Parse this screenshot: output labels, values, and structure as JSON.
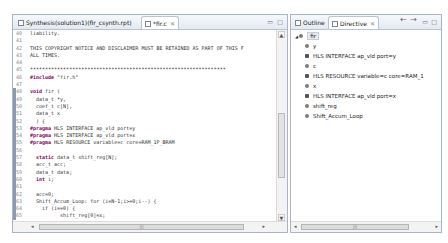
{
  "editor": {
    "tabs": [
      {
        "label": "Synthesis(solution1)(fir_csynth.rpt)",
        "active": false
      },
      {
        "label": "*fir.c",
        "active": true
      }
    ],
    "lines": [
      {
        "n": "40",
        "text": "liability."
      },
      {
        "n": "41",
        "text": ""
      },
      {
        "n": "42",
        "text": "THIS COPYRIGHT NOTICE AND DISCLAIMER MUST BE RETAINED AS PART OF THIS F"
      },
      {
        "n": "43",
        "text": "ALL TIMES."
      },
      {
        "n": "44",
        "text": ""
      },
      {
        "n": "45",
        "text": "*****************************************************************"
      },
      {
        "n": "46",
        "text": "#include \"fir.h\""
      },
      {
        "n": "47",
        "text": ""
      },
      {
        "n": "48",
        "text": "void fir ("
      },
      {
        "n": "49",
        "text": "  data_t *y,"
      },
      {
        "n": "50",
        "text": "  coef_t c[N],"
      },
      {
        "n": "51",
        "text": "  data_t x"
      },
      {
        "n": "52",
        "text": "  ) {"
      },
      {
        "n": "53",
        "text": "#pragma HLS INTERFACE ap_vld port=y"
      },
      {
        "n": "54",
        "text": "#pragma HLS INTERFACE ap_vld port=x"
      },
      {
        "n": "55",
        "text": "#pragma HLS RESOURCE variable=c core=RAM_1P_BRAM"
      },
      {
        "n": "56",
        "text": ""
      },
      {
        "n": "57",
        "text": "  static data_t shift_reg[N];"
      },
      {
        "n": "58",
        "text": "  acc_t acc;"
      },
      {
        "n": "59",
        "text": "  data_t data;"
      },
      {
        "n": "60",
        "text": "  int i;"
      },
      {
        "n": "61",
        "text": ""
      },
      {
        "n": "62",
        "text": "  acc=0;"
      },
      {
        "n": "63",
        "text": "  Shift_Accum_Loop: for (i=N-1;i>=0;i--) {"
      },
      {
        "n": "64",
        "text": "    if (i==0) {"
      },
      {
        "n": "65",
        "text": "          shift_reg[0]=x;"
      }
    ]
  },
  "side": {
    "tabs": [
      {
        "label": "Outline",
        "active": false
      },
      {
        "label": "Directive",
        "active": true
      }
    ],
    "tree": [
      {
        "label": "fir",
        "level": 0,
        "icon": "function-icon"
      },
      {
        "label": "y",
        "level": 1,
        "icon": "port-icon"
      },
      {
        "label": "HLS INTERFACE ap_vld port=y",
        "level": 1,
        "icon": "directive-icon"
      },
      {
        "label": "c",
        "level": 1,
        "icon": "port-icon"
      },
      {
        "label": "HLS RESOURCE variable=c core=RAM_1",
        "level": 1,
        "icon": "directive-icon"
      },
      {
        "label": "x",
        "level": 1,
        "icon": "port-icon"
      },
      {
        "label": "HLS INTERFACE ap_vld port=x",
        "level": 1,
        "icon": "directive-icon"
      },
      {
        "label": "shift_reg",
        "level": 1,
        "icon": "array-icon"
      },
      {
        "label": "Shift_Accum_Loop",
        "level": 1,
        "icon": "loop-icon"
      }
    ]
  }
}
